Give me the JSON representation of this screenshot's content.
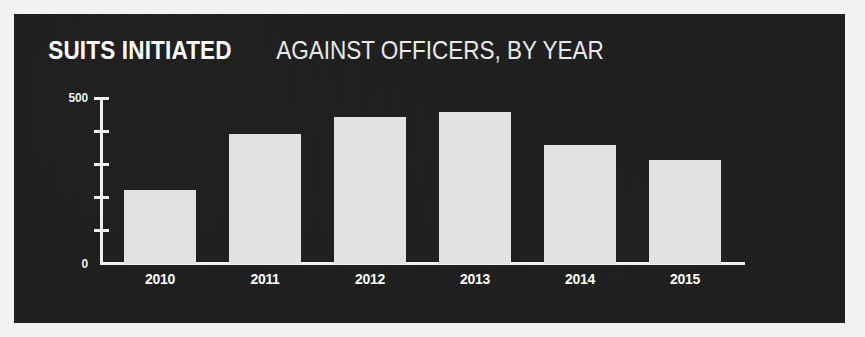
{
  "figure": {
    "background_color": "#f2f2f0",
    "panel_color": "#1e1e1e"
  },
  "title": {
    "strong": "SUITS INITIATED",
    "rest": "AGAINST OFFICERS, BY YEAR",
    "full": "SUITS INITIATED AGAINST OFFICERS, BY YEAR"
  },
  "axis": {
    "y_top_label": "500",
    "y_bottom_label": "0",
    "y_ticks": [
      "500",
      "400",
      "300",
      "200",
      "100",
      "0"
    ]
  },
  "colors": {
    "bar": "#e2e2e0",
    "axis": "#f0f0ee",
    "text": "#ffffff",
    "panel": "#1e1e1e"
  },
  "chart_data": {
    "type": "bar",
    "title": "SUITS INITIATED AGAINST OFFICERS, BY YEAR",
    "subtitle": "",
    "xlabel": "",
    "ylabel": "",
    "categories": [
      "2010",
      "2011",
      "2012",
      "2013",
      "2014",
      "2015"
    ],
    "values": [
      225,
      395,
      445,
      460,
      360,
      315
    ],
    "ylim": [
      0,
      500
    ],
    "yticks": [
      0,
      100,
      200,
      300,
      400,
      500
    ],
    "ytick_labels_shown": [
      "500",
      "0"
    ],
    "grid": false,
    "legend": null,
    "bar_color": "#e2e2e0",
    "series": [
      {
        "name": "Suits initiated against officers",
        "values": [
          225,
          395,
          445,
          460,
          360,
          315
        ]
      }
    ]
  }
}
